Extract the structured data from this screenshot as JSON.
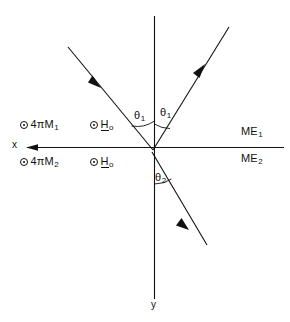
{
  "figure": {
    "type": "ray-diagram",
    "background_color": "#ffffff",
    "stroke_color": "#111111"
  },
  "axes": {
    "x_label": "x",
    "y_label": "y",
    "x_arrow_direction": "left",
    "origin": {
      "x": 152,
      "y": 152
    }
  },
  "rays": [
    {
      "name": "incident-ray",
      "label": "",
      "from": {
        "x": 68,
        "y": 47
      },
      "to": {
        "x": 152,
        "y": 152
      },
      "arrow_at": {
        "x": 95,
        "y": 81
      },
      "arrow_direction": "toward-origin"
    },
    {
      "name": "reflected-ray",
      "label": "",
      "from": {
        "x": 152,
        "y": 152
      },
      "to": {
        "x": 228,
        "y": 27
      },
      "arrow_at": {
        "x": 200,
        "y": 72
      },
      "arrow_direction": "away-from-origin"
    },
    {
      "name": "transmitted-ray",
      "label": "",
      "from": {
        "x": 152,
        "y": 152
      },
      "to": {
        "x": 205,
        "y": 243
      },
      "arrow_at": {
        "x": 184,
        "y": 224
      },
      "arrow_direction": "away-from-origin"
    }
  ],
  "angles": [
    {
      "name": "theta1-left",
      "symbol": "θ",
      "subscript": "1"
    },
    {
      "name": "theta1-right",
      "symbol": "θ",
      "subscript": "1"
    },
    {
      "name": "theta2",
      "symbol": "θ",
      "subscript": "2"
    }
  ],
  "field_labels": {
    "magnetization_upper": {
      "marker": "⊙",
      "text": "4πM",
      "subscript": "1"
    },
    "magnetization_lower": {
      "marker": "⊙",
      "text": "4πM",
      "subscript": "2"
    },
    "bias_field_upper": {
      "marker": "⊙",
      "text": "H",
      "subscript": "o",
      "underlined": true
    },
    "bias_field_lower": {
      "marker": "⊙",
      "text": "H",
      "subscript": "o",
      "underlined": true
    }
  },
  "media_labels": {
    "upper": {
      "text": "ME",
      "subscript": "1"
    },
    "lower": {
      "text": "ME",
      "subscript": "2"
    }
  }
}
